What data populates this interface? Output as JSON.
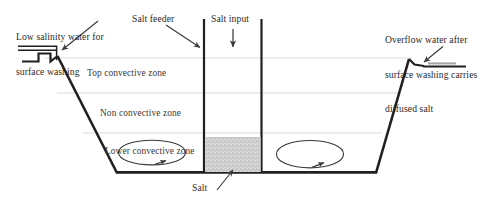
{
  "figure": {
    "type": "schematic-cross-section",
    "background_color": "#ffffff",
    "line_color": "#231f20",
    "zone_divider_color": "#d7d7d7",
    "salt_fill_color": "#cfcfcf"
  },
  "callouts": {
    "low_salinity_inlet": {
      "line1": "Low salinity water for",
      "line2": "surface washing"
    },
    "salt_feeder": {
      "label": "Salt feeder"
    },
    "salt_input": {
      "label": "Salt input"
    },
    "overflow": {
      "line1": "Overflow water after",
      "line2": "surface washing carries",
      "line3": "diffused salt"
    },
    "salt_pile": {
      "label": "Salt"
    }
  },
  "zones": [
    {
      "id": "top-convective-zone",
      "label": "Top convective zone"
    },
    {
      "id": "non-convective-zone",
      "label": "Non convective zone"
    },
    {
      "id": "lower-convective-zone",
      "label": "Lower convective zone"
    }
  ],
  "flow_indicators": [
    {
      "id": "left-circulation",
      "kind": "circulation-loop",
      "direction": "clockwise"
    },
    {
      "id": "right-circulation",
      "kind": "circulation-loop",
      "direction": "clockwise"
    },
    {
      "id": "salt-input-arrow",
      "kind": "down-arrow"
    },
    {
      "id": "inlet-pointer-arrow",
      "kind": "pointer-arrow"
    },
    {
      "id": "feeder-pointer-arrow",
      "kind": "pointer-arrow"
    },
    {
      "id": "overflow-pointer-arrow",
      "kind": "pointer-arrow"
    },
    {
      "id": "salt-pointer-arrow",
      "kind": "pointer-arrow"
    }
  ]
}
